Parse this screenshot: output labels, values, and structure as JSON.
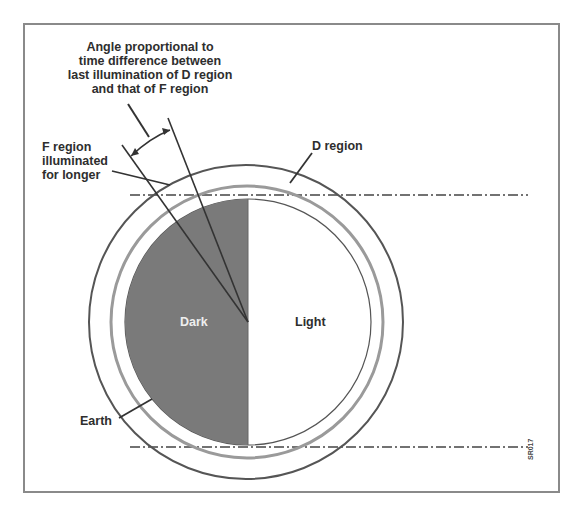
{
  "diagram": {
    "title_annotation": [
      "Angle proportional to",
      "time difference between",
      "last illumination of D region",
      "and that of F region"
    ],
    "labels": {
      "f_region": [
        "F region",
        "illuminated",
        "for longer"
      ],
      "d_region": "D region",
      "earth": "Earth",
      "dark": "Dark",
      "light": "Light"
    },
    "figure_code": "SR017",
    "colors": {
      "dark_half": "#7a7a7a",
      "lines": "#3a3a3a",
      "d_region_ring": "#9a9a9a",
      "frame": "#8a8a8a"
    }
  }
}
